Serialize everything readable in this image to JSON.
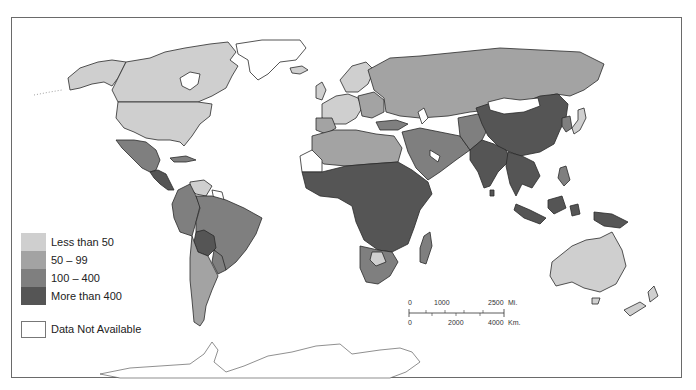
{
  "map": {
    "type": "choropleth-world",
    "colors": {
      "less_than_50": "#cfcfcf",
      "50_99": "#a3a3a3",
      "100_400": "#7f7f7f",
      "more_than_400": "#555555",
      "not_available": "#ffffff",
      "border": "#2a2a2a"
    }
  },
  "legend": {
    "items": [
      {
        "label": "Less than 50",
        "color": "#cfcfcf"
      },
      {
        "label": "50 – 99",
        "color": "#a3a3a3"
      },
      {
        "label": "100 – 400",
        "color": "#7f7f7f"
      },
      {
        "label": "More than 400",
        "color": "#555555"
      }
    ],
    "not_available": {
      "label": "Data Not Available",
      "color": "#ffffff"
    }
  },
  "scale_bar": {
    "miles": {
      "start": "0",
      "mid": "1000",
      "end": "2500",
      "unit": "Mi."
    },
    "km": {
      "start": "0",
      "mid": "2000",
      "end": "4000",
      "unit": "Km."
    }
  },
  "regions": [
    {
      "name": "Canada",
      "class": "less_than_50"
    },
    {
      "name": "United States",
      "class": "less_than_50"
    },
    {
      "name": "Alaska",
      "class": "less_than_50"
    },
    {
      "name": "Greenland",
      "class": "not_available"
    },
    {
      "name": "Mexico",
      "class": "100_400"
    },
    {
      "name": "Central America",
      "class": "more_than_400"
    },
    {
      "name": "Venezuela",
      "class": "less_than_50"
    },
    {
      "name": "Brazil",
      "class": "100_400"
    },
    {
      "name": "Colombia/Peru",
      "class": "100_400"
    },
    {
      "name": "Bolivia",
      "class": "more_than_400"
    },
    {
      "name": "Argentina/Chile",
      "class": "50_99"
    },
    {
      "name": "Western Europe",
      "class": "less_than_50"
    },
    {
      "name": "Eastern Europe",
      "class": "50_99"
    },
    {
      "name": "USSR",
      "class": "50_99"
    },
    {
      "name": "North Africa",
      "class": "50_99"
    },
    {
      "name": "Sub-Saharan Africa",
      "class": "more_than_400"
    },
    {
      "name": "Southern Africa",
      "class": "100_400"
    },
    {
      "name": "Middle East",
      "class": "100_400"
    },
    {
      "name": "China",
      "class": "more_than_400"
    },
    {
      "name": "Mongolia",
      "class": "not_available"
    },
    {
      "name": "India",
      "class": "more_than_400"
    },
    {
      "name": "Southeast Asia",
      "class": "more_than_400"
    },
    {
      "name": "Japan",
      "class": "less_than_50"
    },
    {
      "name": "Korea",
      "class": "100_400"
    },
    {
      "name": "Australia",
      "class": "less_than_50"
    },
    {
      "name": "New Zealand",
      "class": "less_than_50"
    },
    {
      "name": "Antarctica",
      "class": "not_available"
    }
  ]
}
